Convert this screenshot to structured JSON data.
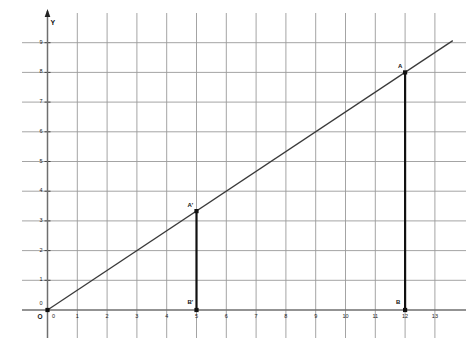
{
  "chart_data": {
    "type": "line",
    "title": "",
    "subtitle": "",
    "xlabel": "",
    "ylabel": "Y",
    "origin_label": "O",
    "xlim": [
      0,
      13
    ],
    "ylim": [
      0,
      9.8
    ],
    "grid": true,
    "legend": "none",
    "x_ticks": [
      "0",
      "1",
      "2",
      "3",
      "4",
      "5",
      "6",
      "7",
      "8",
      "9",
      "10",
      "11",
      "12",
      "13"
    ],
    "x_tick_values": [
      0,
      1,
      2,
      3,
      4,
      5,
      6,
      7,
      8,
      9,
      10,
      11,
      12,
      13
    ],
    "y_ticks": [
      "0",
      "1",
      "2",
      "3",
      "4",
      "5",
      "6",
      "7",
      "8",
      "9"
    ],
    "y_tick_values": [
      0,
      1,
      2,
      3,
      4,
      5,
      6,
      7,
      8,
      9
    ],
    "series": [
      {
        "name": "ray-through-origin",
        "kind": "line",
        "slope": 0.6667,
        "intercept": 0,
        "x": [
          0,
          13.6
        ],
        "values": [
          0,
          9.07
        ],
        "color": "#3a3a3a"
      }
    ],
    "segments": [
      {
        "name": "segment-A-B",
        "x": 12,
        "y_top": 8,
        "y_bottom": 0,
        "color": "#111111"
      },
      {
        "name": "segment-Aprime-Bprime",
        "x": 5,
        "y_top": 3.33,
        "y_bottom": 0,
        "color": "#111111"
      }
    ],
    "points": [
      {
        "label": "A",
        "x": 12,
        "y": 8,
        "label_dx": -7,
        "label_dy": -9
      },
      {
        "label": "B",
        "x": 12,
        "y": 0,
        "label_dx": -9,
        "label_dy": -11
      },
      {
        "label": "A'",
        "x": 5,
        "y": 3.33,
        "label_dx": -9,
        "label_dy": -9
      },
      {
        "label": "B'",
        "x": 5,
        "y": 0,
        "label_dx": -9,
        "label_dy": -11
      }
    ],
    "colors": {
      "grid": "#9a9a9a",
      "axis": "#6f6f6f",
      "line": "#3a3a3a",
      "segment": "#111111",
      "text": "#111111",
      "background": "#ffffff"
    }
  }
}
